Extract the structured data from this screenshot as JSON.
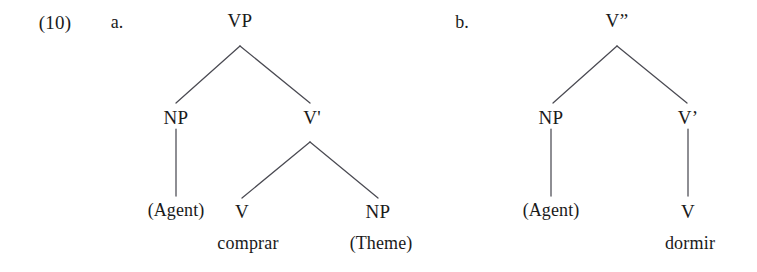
{
  "figure": {
    "example_number": "(10)",
    "type": "syntax-tree-pair"
  },
  "trees": [
    {
      "letter": "a.",
      "root": "VP",
      "nodes": {
        "root": "VP",
        "spec": "NP",
        "bar": "V'",
        "head": "V",
        "complement": "NP"
      },
      "terminals": {
        "spec_role": "(Agent)",
        "head_word": "comprar",
        "complement_role": "(Theme)"
      }
    },
    {
      "letter": "b.",
      "root": "V”",
      "nodes": {
        "root": "V”",
        "spec": "NP",
        "bar": "V’",
        "head": "V"
      },
      "terminals": {
        "spec_role": "(Agent)",
        "head_word": "dormir"
      }
    }
  ],
  "colors": {
    "background": "#ffffff",
    "text": "#1a1a1a",
    "branch_line": "#4a4a52"
  }
}
